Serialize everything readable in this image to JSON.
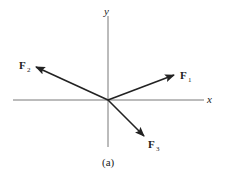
{
  "diagram": {
    "caption": "(a)",
    "axes": {
      "x_label": "x",
      "y_label": "y"
    },
    "vectors": [
      {
        "name": "F",
        "subscript": "1",
        "direction": "up-right",
        "angle_deg": 22
      },
      {
        "name": "F",
        "subscript": "2",
        "direction": "up-left",
        "angle_deg": 152
      },
      {
        "name": "F",
        "subscript": "3",
        "direction": "down-right",
        "angle_deg": -50
      }
    ],
    "colors": {
      "line": "#222222",
      "background": "#ffffff"
    }
  }
}
